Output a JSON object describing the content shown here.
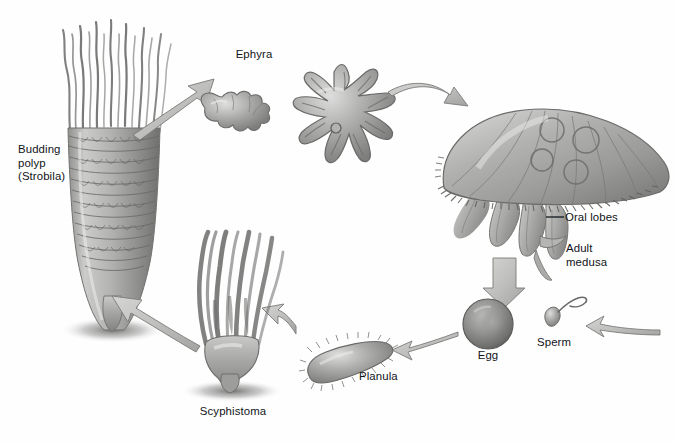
{
  "figure": {
    "background_color": "#fefefe",
    "ink_color": "#111418",
    "art_style": "pencil-shaded grayscale biological illustration",
    "palette": {
      "mid_gray": "#9a9a99",
      "light_gray": "#cdcdcb",
      "dark_gray": "#6d6d6c",
      "outline_gray": "#5c5c5b",
      "shadow_gray": "#8d8d8c",
      "highlight": "#e9e9e7"
    }
  },
  "labels": {
    "budding_polyp": "Budding\npolyp\n(Strobila)",
    "ephyra": "Ephyra",
    "oral_lobes": "Oral lobes",
    "adult_medusa": "Adult\nmedusa",
    "sperm": "Sperm",
    "egg": "Egg",
    "planula": "Planula",
    "scyphistoma": "Scyphistoma"
  },
  "stages": [
    {
      "id": "budding-polyp",
      "label": "Budding\npolyp\n(Strobila)",
      "description": "Tall segmented strobila with stacked discs and fine wavy tentacles at the top, tapering to a pointed stalk with a cast shadow",
      "position": {
        "x": 60,
        "y": 18,
        "width": 120,
        "height": 320
      }
    },
    {
      "id": "ephyra-small",
      "label": "Ephyra",
      "description": "Small side-view ephyra with bifurcated lappets",
      "position": {
        "x": 196,
        "y": 85,
        "width": 84,
        "height": 58
      }
    },
    {
      "id": "ephyra-large",
      "label": "Ephyra",
      "description": "Large star-shaped free-swimming ephyra with eight notched arms and a central manubrium dot",
      "position": {
        "x": 272,
        "y": 62,
        "width": 124,
        "height": 130
      }
    },
    {
      "id": "adult-medusa",
      "label": "Adult\nmedusa",
      "description": "Large domed bell with fringed tentacle margin, radial canals, four circular gonad rings and four trailing oral lobes",
      "position": {
        "x": 432,
        "y": 108,
        "width": 244,
        "height": 160
      }
    },
    {
      "id": "sperm",
      "label": "Sperm",
      "description": "Single spermatozoon, teardrop head with long curved flagellum",
      "position": {
        "x": 536,
        "y": 300,
        "width": 44,
        "height": 40
      }
    },
    {
      "id": "egg",
      "label": "Egg",
      "description": "Spherical egg cell with shaded rim and lighter nucleus",
      "position": {
        "x": 462,
        "y": 298,
        "width": 52,
        "height": 52
      }
    },
    {
      "id": "planula",
      "label": "Planula",
      "description": "Elongated ciliated planula larva tilted diagonally",
      "position": {
        "x": 300,
        "y": 336,
        "width": 110,
        "height": 50
      }
    },
    {
      "id": "scyphistoma",
      "label": "Scyphistoma",
      "description": "Attached polyp with a vase-shaped calyx and a crown of long tentacles, sitting on a cast shadow",
      "position": {
        "x": 186,
        "y": 228,
        "width": 124,
        "height": 172
      }
    }
  ],
  "arrows": [
    {
      "id": "arrow-polyp-to-ephyra",
      "from": "budding-polyp",
      "to": "ephyra-small",
      "direction": "up-right"
    },
    {
      "id": "arrow-ephyra-to-medusa",
      "from": "ephyra-large",
      "to": "adult-medusa",
      "direction": "right-down"
    },
    {
      "id": "arrow-medusa-to-egg",
      "from": "adult-medusa",
      "to": "egg",
      "direction": "down"
    },
    {
      "id": "arrow-sperm-to-egg",
      "from": "sperm",
      "to": "egg",
      "direction": "left"
    },
    {
      "id": "arrow-egg-to-planula",
      "from": "egg",
      "to": "planula",
      "direction": "left"
    },
    {
      "id": "arrow-planula-to-scyphistoma",
      "from": "planula",
      "to": "scyphistoma",
      "direction": "left"
    },
    {
      "id": "arrow-scyphistoma-to-polyp",
      "from": "scyphistoma",
      "to": "budding-polyp",
      "direction": "up-left"
    }
  ],
  "leader_lines": [
    {
      "id": "leader-oral-lobes",
      "label": "Oral lobes",
      "points_to": "adult-medusa"
    }
  ]
}
